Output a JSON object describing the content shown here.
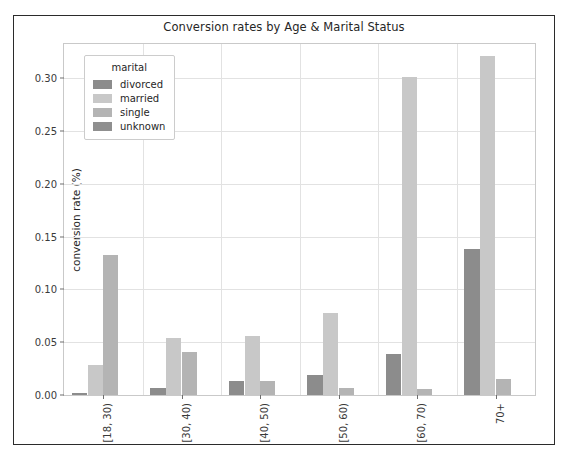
{
  "chart_data": {
    "type": "bar",
    "title": "Conversion rates by Age & Marital Status",
    "xlabel": "age group",
    "ylabel": "conversion rate (%)",
    "categories": [
      "[18, 30)",
      "[30, 40)",
      "[40, 50)",
      "[50, 60)",
      "[60, 70)",
      "70+"
    ],
    "series": [
      {
        "name": "divorced",
        "color": "#8c8c8c",
        "values": [
          0.002,
          0.007,
          0.013,
          0.019,
          0.039,
          0.138
        ]
      },
      {
        "name": "married",
        "color": "#c8c8c8",
        "values": [
          0.028,
          0.054,
          0.056,
          0.078,
          0.301,
          0.321
        ]
      },
      {
        "name": "single",
        "color": "#b4b4b4",
        "values": [
          0.133,
          0.041,
          0.013,
          0.007,
          0.006,
          0.015
        ]
      },
      {
        "name": "unknown",
        "color": "#8f8f8f",
        "values": [
          0.0,
          0.0,
          0.0,
          0.0,
          0.0,
          0.0
        ]
      }
    ],
    "ylim": [
      0.0,
      0.3325
    ],
    "yticks": [
      0.0,
      0.05,
      0.1,
      0.15,
      0.2,
      0.25,
      0.3
    ],
    "ytick_labels": [
      "0.00",
      "0.05",
      "0.10",
      "0.15",
      "0.20",
      "0.25",
      "0.30"
    ],
    "grid": true,
    "legend_title": "marital",
    "legend_position": "upper left"
  }
}
